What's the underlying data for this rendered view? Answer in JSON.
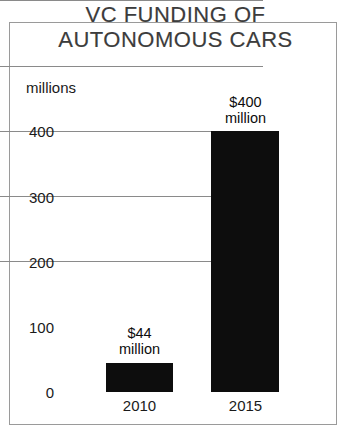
{
  "chart_data": {
    "type": "bar",
    "title": "VC FUNDING OF AUTONOMOUS CARS",
    "title_line1": "VC FUNDING OF",
    "title_line2": "AUTONOMOUS CARS",
    "xlabel": "",
    "ylabel": "millions",
    "categories": [
      "2010",
      "2015"
    ],
    "values": [
      44,
      400
    ],
    "value_labels": [
      {
        "amount": "$44",
        "unit": "million"
      },
      {
        "amount": "$400",
        "unit": "million"
      }
    ],
    "ylim": [
      0,
      400
    ],
    "yticks": [
      400,
      300,
      200,
      100,
      0
    ],
    "ytick_labels": [
      "400",
      "300",
      "200",
      "100",
      "0"
    ],
    "grid": true,
    "legend": false,
    "bar_color": "#0d0d0d",
    "gridline_color": "#8a8a8a",
    "frame_color": "#9a9a9a",
    "background": "#ffffff"
  }
}
